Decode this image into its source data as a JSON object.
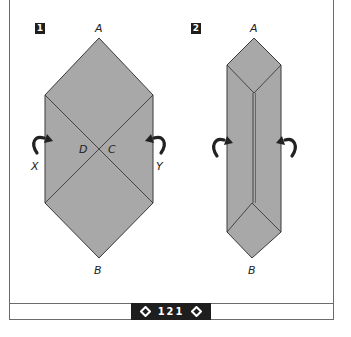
{
  "page": {
    "number": "121",
    "prev_icon": "diamond-left-icon",
    "next_icon": "diamond-right-icon"
  },
  "colors": {
    "paper_fill": "#a8a8a8",
    "paper_fill_light": "#b2b2b2",
    "line": "#3a3a3a",
    "badge_bg": "#1e1e1e"
  },
  "steps": [
    {
      "number": "1",
      "labels": {
        "top": "A",
        "bottom": "B",
        "left": "X",
        "right": "Y",
        "center_left": "D",
        "center_right": "C"
      },
      "arrows": [
        "fold-arrow-left",
        "fold-arrow-right"
      ]
    },
    {
      "number": "2",
      "labels": {
        "top": "A",
        "bottom": "B"
      },
      "arrows": [
        "fold-arrow-left",
        "fold-arrow-right"
      ]
    }
  ]
}
